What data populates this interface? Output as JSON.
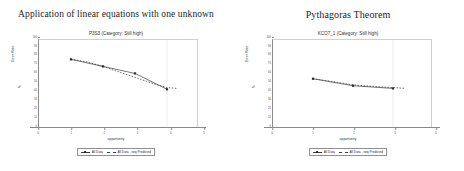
{
  "panels": [
    {
      "main_title": "Application of linear equations with one unknown",
      "sub_title": "P3S3 (Category: Still high)"
    },
    {
      "main_title": "Pythagoras Theorem",
      "sub_title": "KCO7_1 (Category: Still high)"
    }
  ],
  "axes": {
    "ylabel": "Error Rate",
    "yunit": "%",
    "xlabel": "opportunity",
    "yticks": [
      "100",
      "90",
      "80",
      "70",
      "60",
      "50",
      "40",
      "30",
      "20",
      "10",
      "0"
    ],
    "xticks": [
      "0",
      "1",
      "2",
      "3",
      "4",
      "5"
    ]
  },
  "legend": {
    "series_observed": "All Data",
    "series_predicted": "All Data - seq Predicted"
  },
  "colors": {
    "line": "#3a3a3a",
    "marker": "#2b2b2b",
    "axis": "#8a8a8a",
    "text": "#1d1d1d",
    "plot_background": "#ffffff"
  },
  "chart_data": [
    {
      "type": "line",
      "title": "Application of linear equations with one unknown",
      "subtitle": "P3S3 (Category: Still high)",
      "xlabel": "opportunity",
      "ylabel": "Error Rate",
      "yunit": "%",
      "xlim": [
        0,
        5
      ],
      "ylim": [
        0,
        100
      ],
      "grid": false,
      "legend_position": "bottom",
      "categories": [
        1,
        2,
        3,
        4
      ],
      "series": [
        {
          "name": "All Data",
          "style": "solid-with-markers",
          "x": [
            1,
            2,
            3,
            4
          ],
          "values": [
            78,
            70,
            62,
            44
          ]
        },
        {
          "name": "All Data - seq Predicted",
          "style": "dashed",
          "x": [
            1,
            1.2,
            1.5,
            1.8,
            2,
            2.4,
            2.8,
            3.2,
            3.6,
            4,
            4.3
          ],
          "values": [
            78,
            77,
            75,
            72,
            70,
            65,
            60,
            55,
            50,
            46,
            45
          ]
        }
      ]
    },
    {
      "type": "line",
      "title": "Pythagoras Theorem",
      "subtitle": "KCO7_1 (Category: Still high)",
      "xlabel": "opportunity",
      "ylabel": "Error Rate",
      "yunit": "%",
      "xlim": [
        0,
        4
      ],
      "ylim": [
        0,
        100
      ],
      "grid": false,
      "legend_position": "bottom",
      "categories": [
        1,
        2,
        3
      ],
      "series": [
        {
          "name": "All Data",
          "style": "solid-with-markers",
          "x": [
            1,
            2,
            3
          ],
          "values": [
            56,
            48,
            45
          ]
        },
        {
          "name": "All Data - seq Predicted",
          "style": "dashed",
          "x": [
            1,
            1.3,
            1.6,
            2,
            2.3,
            2.6,
            3,
            3.3
          ],
          "values": [
            56,
            54,
            52,
            49,
            48,
            47,
            46,
            45
          ]
        }
      ]
    }
  ]
}
